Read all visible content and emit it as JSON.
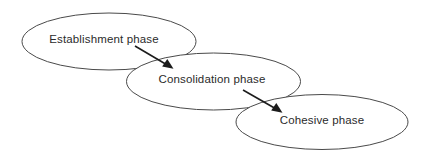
{
  "diagram": {
    "type": "flow-ellipses",
    "canvas": {
      "width": 422,
      "height": 157
    },
    "background_color": "#ffffff",
    "ellipse_stroke_color": "#4a4a4a",
    "label_color": "#2b2b2b",
    "arrow_color": "#1c1c1c",
    "nodes": [
      {
        "id": "establishment",
        "label": "Establishment phase",
        "order": 1,
        "shape": "ellipse",
        "cx": 109,
        "cy": 41.5,
        "rx": 87,
        "ry": 28.5,
        "label_x": 104,
        "label_y": 40
      },
      {
        "id": "consolidation",
        "label": "Consolidation phase",
        "order": 2,
        "shape": "ellipse",
        "cx": 213.5,
        "cy": 81.5,
        "rx": 87,
        "ry": 28.5,
        "label_x": 212,
        "label_y": 80
      },
      {
        "id": "cohesive",
        "label": "Cohesive phase",
        "order": 3,
        "shape": "ellipse",
        "cx": 322,
        "cy": 122,
        "rx": 86,
        "ry": 27.5,
        "label_x": 322,
        "label_y": 121
      }
    ],
    "arrows": [
      {
        "id": "arrow-establishment-to-consolidation",
        "from": "establishment",
        "to": "consolidation",
        "x1": 135,
        "y1": 46,
        "x2": 172,
        "y2": 68
      },
      {
        "id": "arrow-consolidation-to-cohesive",
        "from": "consolidation",
        "to": "cohesive",
        "x1": 243,
        "y1": 90,
        "x2": 281,
        "y2": 112
      }
    ]
  }
}
